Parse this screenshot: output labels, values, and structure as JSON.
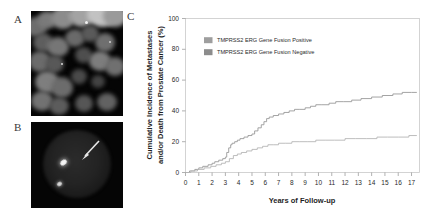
{
  "figure": {
    "panels": [
      {
        "id": "A",
        "label": "A",
        "kind": "fluorescence-micrograph",
        "description": "Interphase nuclei with fluorescence in situ hybridization signals"
      },
      {
        "id": "B",
        "label": "B",
        "kind": "fluorescence-micrograph",
        "description": "Single nucleus with arrow marking a fusion signal"
      },
      {
        "id": "C",
        "label": "C",
        "kind": "cumulative-incidence-plot"
      }
    ]
  },
  "chart_data": {
    "type": "line",
    "title": "",
    "xlabel": "Years of Follow-up",
    "ylabel": "Cumulative Incidence of Metastases and/or Death from Prostate Cancer (%)",
    "xlim": [
      0,
      17.6
    ],
    "ylim": [
      0,
      100
    ],
    "xticks": [
      0,
      1,
      2,
      3,
      4,
      5,
      6,
      7,
      8,
      9,
      10,
      11,
      12,
      13,
      14,
      15,
      16,
      17
    ],
    "xtick_labels": [
      "0",
      "1",
      "2",
      "3",
      "4",
      "5",
      "6",
      "7",
      "8",
      "9",
      "10",
      "11",
      "12",
      "13",
      "14",
      "15",
      "16",
      "17"
    ],
    "yticks": [
      0,
      20,
      40,
      60,
      80,
      100
    ],
    "ytick_labels": [
      "0",
      "20",
      "40",
      "60",
      "80",
      "100"
    ],
    "grid": false,
    "legend_position": "upper-left-inside",
    "step": "post",
    "series": [
      {
        "name": "TMPRSS2 ERG Gene Fusion Positive",
        "color": "#9a9a9a",
        "final_value": 52,
        "x": [
          0,
          0.3,
          0.7,
          1.0,
          1.3,
          1.7,
          2.0,
          2.2,
          2.5,
          2.8,
          3.0,
          3.1,
          3.25,
          3.4,
          3.5,
          3.7,
          3.9,
          4.1,
          4.4,
          4.7,
          5.0,
          5.2,
          5.45,
          5.7,
          5.9,
          6.1,
          6.3,
          6.6,
          7.0,
          7.4,
          7.8,
          8.2,
          8.6,
          9.0,
          9.4,
          9.8,
          10.2,
          10.8,
          11.3,
          11.9,
          12.5,
          13.2,
          14.0,
          14.8,
          15.6,
          16.3,
          17.0,
          17.4
        ],
        "y": [
          0,
          1,
          2,
          3,
          4,
          5,
          6,
          7,
          8,
          9,
          10,
          13,
          16,
          18,
          19,
          20,
          21,
          22,
          23,
          24,
          25,
          27,
          29,
          31,
          33,
          35,
          36,
          37,
          38,
          39,
          40,
          41,
          41,
          42,
          43,
          44,
          44,
          45,
          46,
          46,
          47,
          48,
          49,
          50,
          51,
          52,
          52,
          52
        ]
      },
      {
        "name": "TMPRSS2 ERG Gene Fusion Negative",
        "color": "#b5b5b5",
        "final_value": 24,
        "x": [
          0,
          0.4,
          0.9,
          1.4,
          1.9,
          2.3,
          2.7,
          3.0,
          3.3,
          3.6,
          3.9,
          4.2,
          4.6,
          5.0,
          5.4,
          5.8,
          6.2,
          6.6,
          7.0,
          7.5,
          8.0,
          8.6,
          9.2,
          9.8,
          10.5,
          11.2,
          12.0,
          12.8,
          13.6,
          14.4,
          15.2,
          16.0,
          16.8,
          17.4
        ],
        "y": [
          0,
          1,
          2,
          3,
          4,
          5,
          6,
          7,
          9,
          11,
          12,
          13,
          14,
          15,
          16,
          17,
          18,
          18,
          19,
          19,
          20,
          20,
          20,
          21,
          21,
          21,
          22,
          22,
          22,
          23,
          23,
          23,
          24,
          24
        ]
      }
    ]
  },
  "axes": {
    "y_title_line1": "Cumulative Incidence of Metastases",
    "y_title_line2": "and/or Death from Prostate Cancer (%)",
    "x_title": "Years of Follow-up"
  },
  "legend": {
    "entries": [
      {
        "label": "TMPRSS2 ERG Gene Fusion Positive",
        "swatch": "#9e9e9e"
      },
      {
        "label": "TMPRSS2 ERG Gene Fusion Negative",
        "swatch": "#8c8c8c"
      }
    ]
  },
  "colors": {
    "frame": "#c9c9c9",
    "text": "#2a2a2a",
    "micrograph_background": "#050505"
  }
}
